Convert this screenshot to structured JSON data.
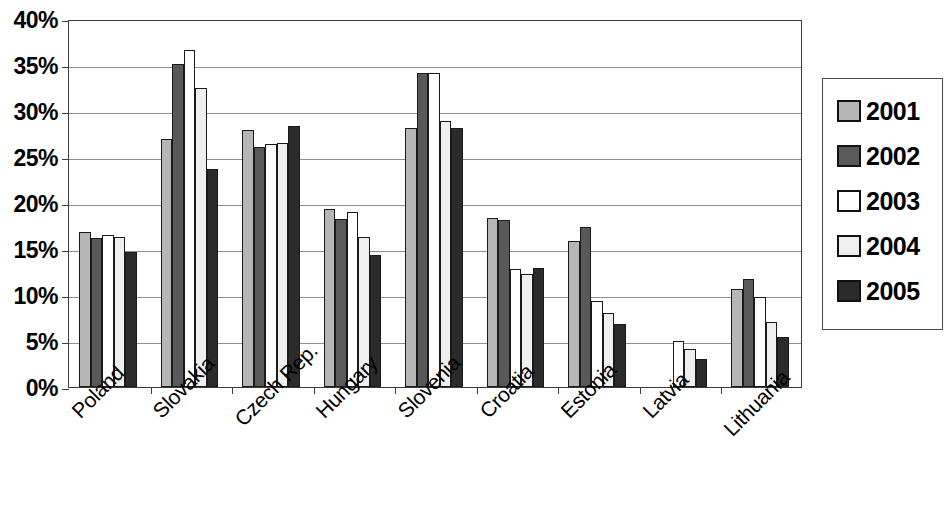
{
  "chart_data": {
    "type": "bar",
    "title": "",
    "subtitle": "",
    "xlabel": "",
    "ylabel": "",
    "ylim": [
      0,
      40
    ],
    "ytick_labels": [
      "0%",
      "5%",
      "10%",
      "15%",
      "20%",
      "25%",
      "30%",
      "35%",
      "40%"
    ],
    "ytick_values": [
      0,
      5,
      10,
      15,
      20,
      25,
      30,
      35,
      40
    ],
    "grid": true,
    "legend_position": "right",
    "value_unit": "%",
    "categories": [
      "Poland",
      "Slovakia",
      "Czech Rep.",
      "Hungary",
      "Slovenia",
      "Croatia",
      "Estonia",
      "Latvia",
      "Lithuania"
    ],
    "series": [
      {
        "name": "2001",
        "color": "#b6b6b6",
        "values": [
          16.9,
          27.0,
          27.9,
          19.4,
          28.1,
          18.4,
          15.9,
          null,
          10.6
        ]
      },
      {
        "name": "2002",
        "color": "#595959",
        "values": [
          16.2,
          35.1,
          26.1,
          18.3,
          34.1,
          18.2,
          17.4,
          null,
          11.7
        ]
      },
      {
        "name": "2003",
        "color": "#ffffff",
        "values": [
          16.5,
          36.6,
          26.4,
          19.0,
          34.1,
          12.8,
          9.3,
          5.0,
          9.8
        ]
      },
      {
        "name": "2004",
        "color": "#efefef",
        "values": [
          16.3,
          32.5,
          26.5,
          16.3,
          28.9,
          12.3,
          8.0,
          4.1,
          7.1
        ]
      },
      {
        "name": "2005",
        "color": "#2b2b2b",
        "values": [
          14.7,
          23.7,
          28.4,
          14.3,
          28.1,
          12.9,
          6.9,
          3.0,
          5.4
        ]
      }
    ]
  },
  "legend": {
    "items": [
      {
        "label": "2001",
        "color": "#b6b6b6"
      },
      {
        "label": "2002",
        "color": "#595959"
      },
      {
        "label": "2003",
        "color": "#ffffff"
      },
      {
        "label": "2004",
        "color": "#efefef"
      },
      {
        "label": "2005",
        "color": "#2b2b2b"
      }
    ]
  },
  "axis": {
    "y_tick_labels": [
      "40%",
      "35%",
      "30%",
      "25%",
      "20%",
      "15%",
      "10%",
      "5%",
      "0%"
    ],
    "x_tick_labels": [
      "Poland",
      "Slovakia",
      "Czech Rep.",
      "Hungary",
      "Slovenia",
      "Croatia",
      "Estonia",
      "Latvia",
      "Lithuania"
    ]
  }
}
